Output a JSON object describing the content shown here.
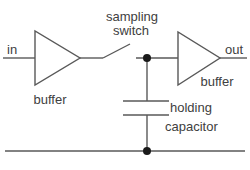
{
  "diagram": {
    "kind": "circuit-diagram",
    "labels": {
      "input": "in",
      "sampling_switch_line1": "sampling",
      "sampling_switch_line2": "switch",
      "output": "out",
      "buffer_left": "buffer",
      "buffer_right": "buffer",
      "holding_capacitor_line1": "holding",
      "holding_capacitor_line2": "capacitor"
    },
    "colors": {
      "wire": "#595959",
      "text": "#404040",
      "node_dot": "#1a1a1a",
      "background": "#ffffff"
    }
  }
}
